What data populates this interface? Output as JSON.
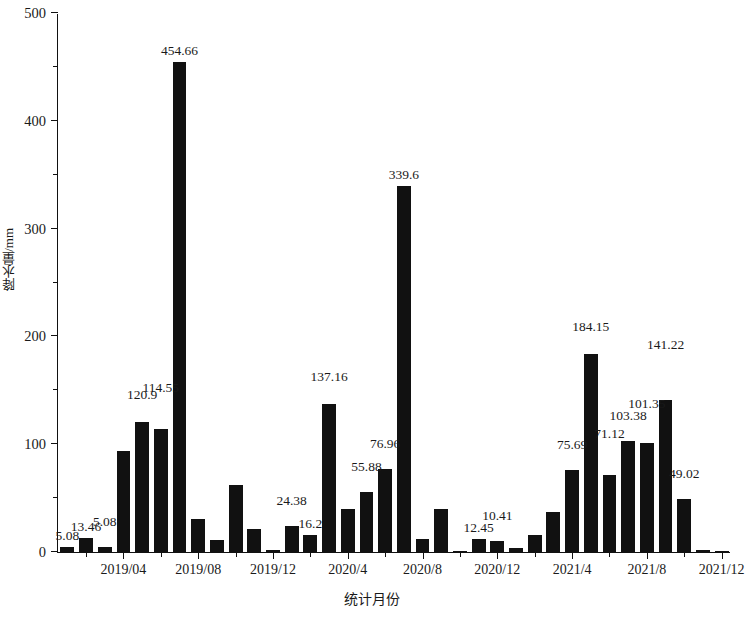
{
  "chart_data": {
    "type": "bar",
    "title": "",
    "xlabel": "统计月份",
    "ylabel": "降水量/mm",
    "ylim": [
      0,
      500
    ],
    "ytick_values": [
      0,
      100,
      200,
      300,
      400,
      500
    ],
    "ytick_labels": [
      "0",
      "100",
      "200",
      "300",
      "400",
      "500"
    ],
    "yminor_values": [
      50,
      150,
      250,
      350,
      450
    ],
    "grid": false,
    "legend": null,
    "bar_color": "#111111",
    "xtick_labels": [
      "2019/04",
      "2019/08",
      "2019/12",
      "2020/4",
      "2020/8",
      "2020/12",
      "2021/4",
      "2021/8",
      "2021/12"
    ],
    "xtick_indices": [
      3,
      7,
      11,
      15,
      19,
      23,
      27,
      31,
      35
    ],
    "categories": [
      "2019/01",
      "2019/02",
      "2019/03",
      "2019/04",
      "2019/05",
      "2019/06",
      "2019/07",
      "2019/08",
      "2019/09",
      "2019/10",
      "2019/11",
      "2019/12",
      "2020/01",
      "2020/02",
      "2020/03",
      "2020/04",
      "2020/05",
      "2020/06",
      "2020/07",
      "2020/08",
      "2020/09",
      "2020/10",
      "2020/11",
      "2020/12",
      "2021/01",
      "2021/02",
      "2021/03",
      "2021/04",
      "2021/05",
      "2021/06",
      "2021/07",
      "2021/08",
      "2021/09",
      "2021/10",
      "2021/11",
      "2021/12"
    ],
    "values": [
      5.08,
      13.46,
      5.08,
      93.5,
      120.9,
      114.55,
      454.66,
      30.5,
      11.0,
      62.0,
      21.5,
      1.5,
      24.38,
      16.2,
      137.16,
      40.0,
      55.88,
      76.96,
      339.6,
      12.0,
      40.0,
      1.2,
      12.45,
      10.41,
      4.0,
      16.0,
      37.5,
      75.69,
      184.15,
      71.12,
      103.38,
      101.35,
      141.22,
      49.02,
      2.0,
      0.0
    ],
    "point_labels": [
      {
        "index": 0,
        "text": "5.08"
      },
      {
        "index": 1,
        "text": "13.46"
      },
      {
        "index": 2,
        "text": "5.08"
      },
      {
        "index": 4,
        "text": "120.9"
      },
      {
        "index": 5,
        "text": "114.55"
      },
      {
        "index": 6,
        "text": "454.66"
      },
      {
        "index": 12,
        "text": "24.38"
      },
      {
        "index": 13,
        "text": "16.2"
      },
      {
        "index": 14,
        "text": "137.16"
      },
      {
        "index": 16,
        "text": "55.88"
      },
      {
        "index": 17,
        "text": "76.96"
      },
      {
        "index": 18,
        "text": "339.6"
      },
      {
        "index": 22,
        "text": "12.45"
      },
      {
        "index": 23,
        "text": "10.41"
      },
      {
        "index": 27,
        "text": "75.69"
      },
      {
        "index": 28,
        "text": "184.15"
      },
      {
        "index": 29,
        "text": "71.12"
      },
      {
        "index": 30,
        "text": "103.38"
      },
      {
        "index": 31,
        "text": "101.35"
      },
      {
        "index": 32,
        "text": "141.22"
      },
      {
        "index": 33,
        "text": "49.02"
      }
    ]
  }
}
